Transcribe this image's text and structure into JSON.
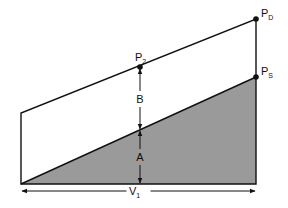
{
  "diagram": {
    "background": "#ffffff",
    "line_color": "#111111",
    "fill_color": "#9a9a9a",
    "outline": {
      "bottom_left": [
        21,
        184
      ],
      "top_left": [
        21,
        113
      ],
      "top_right": [
        256,
        19
      ],
      "bottom_right": [
        256,
        184
      ]
    },
    "shaded_region": {
      "points": [
        [
          21,
          184
        ],
        [
          256,
          77
        ],
        [
          256,
          184
        ]
      ]
    },
    "points": [
      {
        "id": "PD",
        "label": "P",
        "subscript": "D",
        "x": 256,
        "y": 19
      },
      {
        "id": "P2",
        "label": "P",
        "subscript": "2",
        "x": 140,
        "y": 67
      },
      {
        "id": "PS",
        "label": "P",
        "subscript": "S",
        "x": 256,
        "y": 77
      }
    ],
    "dimensions": [
      {
        "id": "B",
        "label": "B",
        "x": 140,
        "y1": 69,
        "y2": 129
      },
      {
        "id": "A",
        "label": "A",
        "x": 140,
        "y1": 131,
        "y2": 183
      }
    ],
    "base_dimension": {
      "label": "V",
      "subscript": "1",
      "x1": 22,
      "x2": 255,
      "y": 191
    }
  }
}
